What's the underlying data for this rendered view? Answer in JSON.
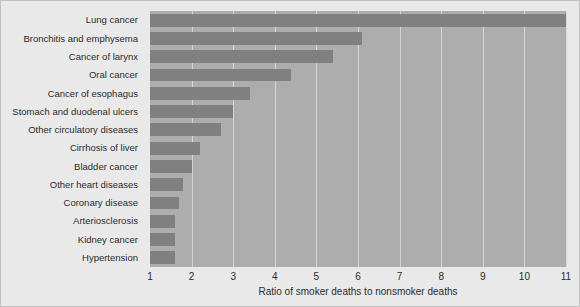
{
  "chart_data": {
    "type": "bar",
    "orientation": "horizontal",
    "title": "",
    "xlabel": "Ratio of smoker deaths to nonsmoker deaths",
    "ylabel": "",
    "xlim": [
      1,
      11
    ],
    "xticks": [
      1,
      2,
      3,
      4,
      5,
      6,
      7,
      8,
      9,
      10,
      11
    ],
    "grid": true,
    "legend": null,
    "categories": [
      "Lung cancer",
      "Bronchitis and emphysema",
      "Cancer of larynx",
      "Oral cancer",
      "Cancer of esophagus",
      "Stomach and duodenal ulcers",
      "Other circulatory diseases",
      "Cirrhosis of liver",
      "Bladder cancer",
      "Other heart diseases",
      "Coronary disease",
      "Arteriosclerosis",
      "Kidney cancer",
      "Hypertension"
    ],
    "values": [
      11.0,
      6.1,
      5.4,
      4.4,
      3.4,
      3.0,
      2.7,
      2.2,
      2.0,
      1.8,
      1.7,
      1.6,
      1.6,
      1.6
    ]
  },
  "colors": {
    "page_background": "#e9e9e9",
    "plot_background": "#adadad",
    "bar": "#808080",
    "gridline": "#d6d6d6",
    "text": "#2b2b2b",
    "border": "#c2c2c2"
  }
}
